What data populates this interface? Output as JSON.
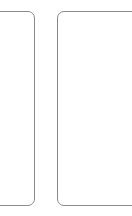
{
  "canvas": {
    "width": 132,
    "height": 216,
    "background_color": "#ffffff",
    "description": "Blank white viewport showing two adjacent empty rounded-rectangle panels, both cropped by the viewport edges."
  },
  "style": {
    "border_color": "#8a8a8a",
    "border_width_px": 1,
    "corner_radius_px": 7,
    "panel_fill_color": "#ffffff"
  },
  "panels": [
    {
      "id": "left-panel",
      "label": "",
      "content": "",
      "cropped_edge": "left",
      "visible_left_px": 0,
      "visible_right_px": 35,
      "top_px": 11,
      "bottom_px": 206
    },
    {
      "id": "right-panel",
      "label": "",
      "content": "",
      "cropped_edge": "right",
      "visible_left_px": 57,
      "visible_right_px": 132,
      "top_px": 11,
      "bottom_px": 206
    }
  ],
  "gap": {
    "between_panels_px": 22
  }
}
